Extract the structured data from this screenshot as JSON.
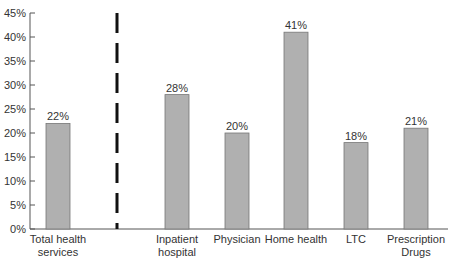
{
  "chart_data": {
    "type": "bar",
    "title": "",
    "xlabel": "",
    "ylabel": "",
    "categories": [
      "Total health services",
      "Inpatient hospital",
      "Physician",
      "Home health",
      "LTC",
      "Prescription Drugs"
    ],
    "category_lines": [
      [
        "Total health",
        "services"
      ],
      [
        "Inpatient",
        "hospital"
      ],
      [
        "Physician"
      ],
      [
        "Home health"
      ],
      [
        "LTC"
      ],
      [
        "Prescription",
        "Drugs"
      ]
    ],
    "values": [
      22,
      28,
      20,
      41,
      18,
      21
    ],
    "value_labels": [
      "22%",
      "28%",
      "20%",
      "41%",
      "18%",
      "21%"
    ],
    "ylim": [
      0,
      45
    ],
    "yticks": [
      "0%",
      "5%",
      "10%",
      "15%",
      "20%",
      "25%",
      "30%",
      "35%",
      "40%",
      "45%"
    ],
    "grid": false,
    "separator": "dashed vertical line between Total health services and the category bars",
    "bar_color": "#b0b0b0"
  }
}
